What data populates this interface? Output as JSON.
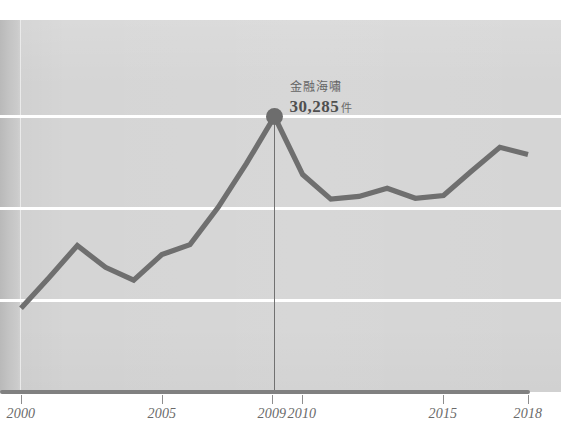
{
  "chart_data": {
    "type": "line",
    "title": "",
    "subtitle": "",
    "xlabel": "",
    "ylabel": "",
    "grid": true,
    "legend_position": "none",
    "xlim": [
      2000,
      2018
    ],
    "ylim": [
      0,
      36000
    ],
    "x_tick_labels": [
      "2000",
      "2005",
      "2009",
      "2010",
      "2015",
      "2018"
    ],
    "x_tick_values": [
      2000,
      2005,
      2009,
      2010,
      2015,
      2018
    ],
    "gridline_values": [
      30285,
      20000,
      10000
    ],
    "series": [
      {
        "name": "件數",
        "color": "#6f6f6f",
        "x": [
          2000,
          2001,
          2002,
          2003,
          2004,
          2005,
          2006,
          2007,
          2008,
          2009,
          2010,
          2011,
          2012,
          2013,
          2014,
          2015,
          2016,
          2017,
          2018
        ],
        "values": [
          9200,
          12600,
          16100,
          13700,
          12300,
          15100,
          16200,
          20300,
          25100,
          30285,
          23900,
          21200,
          21500,
          22400,
          21300,
          21600,
          24300,
          26900,
          26100
        ]
      }
    ],
    "annotations": [
      {
        "label": "金融海嘯",
        "value": "30,285",
        "unit": "件",
        "x": 2009,
        "y": 30285,
        "marker": "filled-circle",
        "drop_line": true
      }
    ]
  },
  "axis": {
    "ticks": [
      {
        "label": "2000",
        "x": 21
      },
      {
        "label": "2005",
        "x": 162
      },
      {
        "label": "2009",
        "x": 272
      },
      {
        "label": "2010",
        "x": 302
      },
      {
        "label": "2015",
        "x": 443
      },
      {
        "label": "2018",
        "x": 528
      }
    ]
  },
  "colors": {
    "line": "#6f6f6f",
    "panel": "#d5d5d5",
    "gridline": "#ffffff",
    "axis": "#808080",
    "annotation_text": "#575757"
  }
}
